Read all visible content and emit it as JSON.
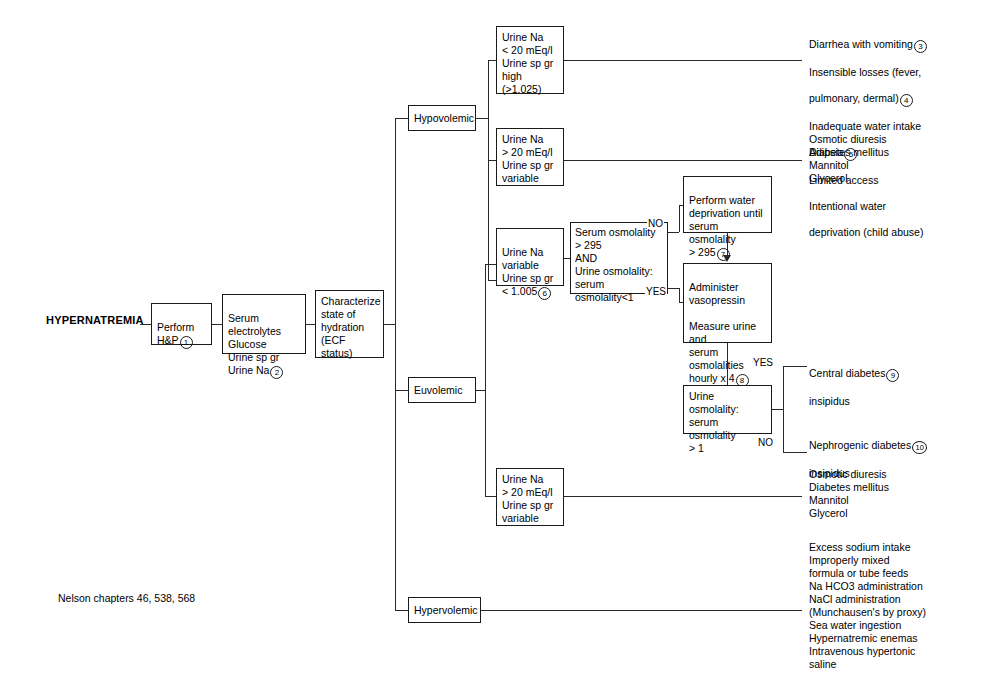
{
  "title": "HYPERNATREMIA",
  "footer": "Nelson chapters 46, 538, 568",
  "nodes": {
    "perform_hp": "Perform\nH&P",
    "perform_hp_num": "1",
    "labs": "Serum electrolytes\nGlucose\nUrine sp gr\nUrine Na",
    "labs_num": "2",
    "characterize": "Characterize\nstate of\nhydration\n(ECF status)",
    "hypovolemic": "Hypovolemic",
    "euvolemic": "Euvolemic",
    "hypervolemic": "Hypervolemic",
    "hypo_box1": "Urine Na\n< 20 mEq/l\nUrine sp gr\n  high (>1.025)",
    "hypo_box2": "Urine Na\n> 20 mEq/l\nUrine sp gr\nvariable",
    "euv_box1": "Urine Na\nvariable\nUrine sp gr\n< 1.005",
    "euv_box1_num": "6",
    "euv_box2": "Urine Na\n> 20 mEq/l\nUrine sp gr\nvariable",
    "serum_osm": "Serum osmolality\n> 295\n        AND\nUrine osmolality:\nserum osmolality<1",
    "water_dep": "Perform water\ndeprivation until\nserum osmolality\n> 295",
    "water_dep_num": "7",
    "vasopressin": "Administer\nvasopressin\n\nMeasure urine and\nserum osmolalities\nhourly x 4",
    "vasopressin_num": "8",
    "urine_osm_ratio": "Urine osmolality:\nserum osmolality\n> 1"
  },
  "labels": {
    "no_upper": "NO",
    "yes_upper": "YES",
    "yes_lower": "YES",
    "no_lower": "NO"
  },
  "outcomes": {
    "hypo_low_na": {
      "line1": "Diarrhea with vomiting",
      "num1": "3",
      "line2": "Insensible losses (fever,",
      "line3": "    pulmonary, dermal)",
      "num4": "4",
      "line4": "Inadequate water intake",
      "line5": "    Adipsia",
      "num5": "5",
      "line6": "    Limited access",
      "line7": "    Intentional water",
      "line8": "     deprivation (child abuse)"
    },
    "osmotic_diuresis_1": "Osmotic diuresis\n    Diabetes mellitus\n    Mannitol\n    Glycerol",
    "central_di": "Central diabetes",
    "central_di_num": "9",
    "central_di_line2": "    insipidus",
    "nephrogenic_di": "Nephrogenic diabetes",
    "nephrogenic_di_num": "10",
    "nephrogenic_di_line2": "    insipidus",
    "osmotic_diuresis_2": "Osmotic diuresis\n    Diabetes mellitus\n    Mannitol\n    Glycerol",
    "hypervolemic_causes": "Excess sodium intake\n    Improperly mixed\n        formula or tube feeds\nNa HCO3 administration\nNaCl administration\n    (Munchausen's by proxy)\nSea water ingestion\nHypernatremic enemas\nIntravenous hypertonic\n    saline"
  },
  "colors": {
    "line": "#2a2a2a",
    "border": "#1a1a1a",
    "text": "#000000",
    "background": "#ffffff"
  }
}
